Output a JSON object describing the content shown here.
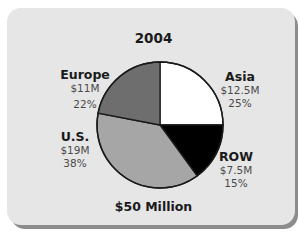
{
  "chart_data": {
    "type": "pie",
    "title": "2004",
    "total_label": "$50 Million",
    "slices": [
      {
        "label": "Asia",
        "value_label": "$12.5M",
        "value": 12.5,
        "percent": 25,
        "percent_label": "25%",
        "color": "#ffffff"
      },
      {
        "label": "ROW",
        "value_label": "$7.5M",
        "value": 7.5,
        "percent": 15,
        "percent_label": "15%",
        "color": "#000000"
      },
      {
        "label": "U.S.",
        "value_label": "$19M",
        "value": 19,
        "percent": 38,
        "percent_label": "38%",
        "color": "#a6a6a6"
      },
      {
        "label": "Europe",
        "value_label": "$11M",
        "value": 11,
        "percent": 22,
        "percent_label": "22%",
        "color": "#6e6e6e"
      }
    ],
    "start_angle": "12 o'clock",
    "direction": "clockwise",
    "legend": "none (direct labels)"
  }
}
